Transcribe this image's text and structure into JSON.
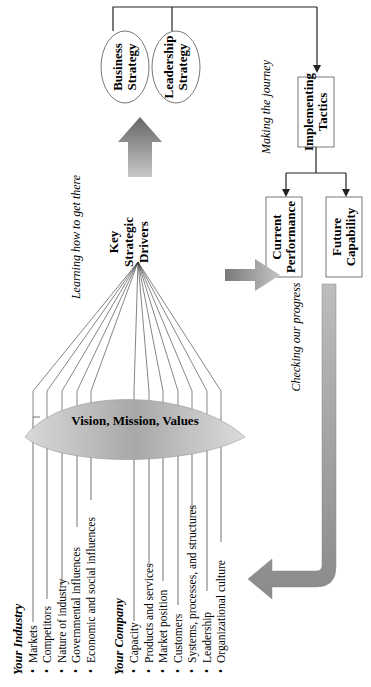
{
  "diagram": {
    "orientation": "rotated-90-ccw",
    "industry": {
      "heading": "Your Industry",
      "items": [
        "Markets",
        "Competitors",
        "Nature of industry",
        "Governmental influences",
        "Economic and social influences"
      ]
    },
    "company": {
      "heading": "Your Company",
      "items": [
        "Capacity",
        "Products and services",
        "Market position",
        "Customers",
        "Systems, processes, and structures",
        "Leadership",
        "Organizational culture"
      ]
    },
    "lens_label": "Vision, Mission, Values",
    "key_drivers": [
      "Key",
      "Strategic",
      "Drivers"
    ],
    "strategies": [
      {
        "line1": "Business",
        "line2": "Strategy"
      },
      {
        "line1": "Leadership",
        "line2": "Strategy"
      }
    ],
    "tactics": {
      "line1": "Implementing",
      "line2": "Tactics"
    },
    "outcomes": [
      {
        "line1": "Current",
        "line2": "Performance"
      },
      {
        "line1": "Future",
        "line2": "Capability"
      }
    ],
    "phase_labels": {
      "learning": "Learning how to get there",
      "making": "Making the journey",
      "checking": "Checking our progress"
    },
    "bullet": "•",
    "colors": {
      "line": "#222222",
      "arrow_dark": "#6a6a6a",
      "arrow_light": "#c8c8c8",
      "lens_dark": "#8a8a8a",
      "lens_light": "#e4e4e4",
      "box_border": "#555555"
    }
  }
}
